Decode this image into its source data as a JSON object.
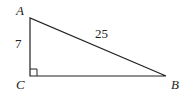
{
  "diagram": {
    "type": "right-triangle",
    "vertices": {
      "A": {
        "label": "A"
      },
      "B": {
        "label": "B"
      },
      "C": {
        "label": "C"
      }
    },
    "sides": {
      "AC": {
        "label": "7"
      },
      "AB": {
        "label": "25"
      }
    },
    "right_angle_at": "C",
    "stroke_color": "#222222"
  }
}
